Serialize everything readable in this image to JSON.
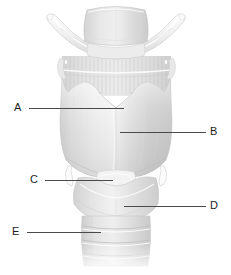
{
  "figure": {
    "style": "grayscale pencil anatomical illustration",
    "background_color": "#ffffff",
    "label_color": "#1d1d1d",
    "leader_line_color": "#4a4a4a",
    "structures": [
      "hyoid bone",
      "epiglottis",
      "thyrohyoid membrane",
      "superior horn of thyroid cartilage",
      "thyroid cartilage lamina",
      "superior thyroid notch",
      "inferior horn of thyroid cartilage",
      "cricothyroid ligament",
      "cricoid cartilage",
      "tracheal rings"
    ]
  },
  "labels": [
    {
      "id": "A",
      "text": "A",
      "points_to": "superior thyroid notch"
    },
    {
      "id": "B",
      "text": "B",
      "points_to": "thyroid cartilage lamina"
    },
    {
      "id": "C",
      "text": "C",
      "points_to": "cricothyroid ligament"
    },
    {
      "id": "D",
      "text": "D",
      "points_to": "cricoid cartilage"
    },
    {
      "id": "E",
      "text": "E",
      "points_to": "tracheal rings"
    }
  ]
}
